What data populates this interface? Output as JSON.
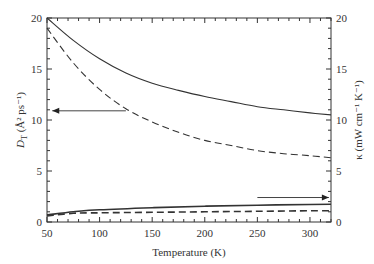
{
  "chart_data": {
    "type": "line",
    "title": "",
    "xlabel": "Temperature (K)",
    "ylabel_left": "D_T (Å² ps⁻¹)",
    "ylabel_right": "κ (mW cm⁻¹ K⁻¹)",
    "xlim": [
      50,
      320
    ],
    "ylim_left": [
      0,
      20
    ],
    "ylim_right": [
      0,
      20
    ],
    "x_ticks": [
      50,
      100,
      150,
      200,
      250,
      300
    ],
    "y_ticks_left": [
      0,
      5,
      10,
      15,
      20
    ],
    "y_ticks_right": [
      0,
      5,
      10,
      15,
      20
    ],
    "grid": false,
    "legend": "none",
    "series": [
      {
        "name": "D_T solid",
        "axis": "left",
        "style": "solid",
        "x": [
          50,
          75,
          100,
          125,
          150,
          175,
          200,
          225,
          250,
          275,
          300,
          320
        ],
        "values": [
          20.0,
          17.8,
          16.0,
          14.6,
          13.6,
          12.9,
          12.3,
          11.8,
          11.3,
          11.0,
          10.7,
          10.5
        ]
      },
      {
        "name": "D_T dashed",
        "axis": "left",
        "style": "dashed",
        "x": [
          50,
          75,
          100,
          125,
          150,
          175,
          200,
          225,
          250,
          275,
          300,
          320
        ],
        "values": [
          19.0,
          15.6,
          13.0,
          11.1,
          9.8,
          8.8,
          8.0,
          7.5,
          7.0,
          6.7,
          6.5,
          6.3
        ]
      },
      {
        "name": "κ solid",
        "axis": "right",
        "style": "solid",
        "x": [
          50,
          75,
          100,
          150,
          200,
          250,
          300,
          320
        ],
        "values": [
          0.7,
          1.0,
          1.2,
          1.4,
          1.55,
          1.65,
          1.72,
          1.75
        ]
      },
      {
        "name": "κ dashed",
        "axis": "right",
        "style": "dashed",
        "x": [
          50,
          75,
          100,
          150,
          200,
          250,
          300,
          320
        ],
        "values": [
          0.6,
          0.85,
          0.9,
          0.95,
          1.0,
          1.05,
          1.1,
          1.1
        ]
      }
    ],
    "annotations": [
      {
        "type": "arrow",
        "direction": "left",
        "from": [
          125,
          10.9
        ],
        "to": [
          55,
          10.9
        ],
        "meaning": "upper curves refer to left axis"
      },
      {
        "type": "arrow",
        "direction": "right",
        "from": [
          250,
          2.4
        ],
        "to": [
          318,
          2.4
        ],
        "meaning": "lower curves refer to right axis"
      }
    ]
  },
  "labels": {
    "xlabel": "Temperature (K)",
    "ylabel_left_main": "D",
    "ylabel_left_sub": "T",
    "ylabel_left_rest": " (Å² ps⁻¹)",
    "ylabel_right": "κ (mW cm⁻¹ K⁻¹)"
  }
}
